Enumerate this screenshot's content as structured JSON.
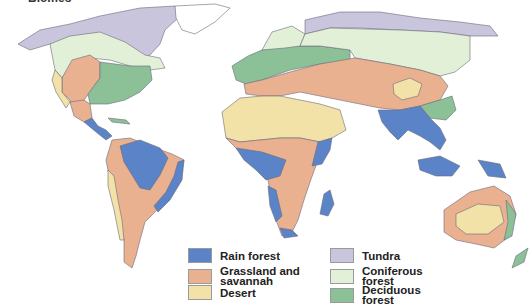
{
  "title": "Biomes",
  "colors": {
    "rain_forest": "#5b83c8",
    "grassland": "#eab191",
    "desert": "#f3e2a8",
    "tundra": "#c8c5dc",
    "coniferous": "#e3f0d8",
    "deciduous": "#8cc198",
    "ice": "#ffffff",
    "outline": "#6a6a7a"
  },
  "legend": {
    "items": [
      {
        "key": "rain_forest",
        "label": "Rain forest",
        "color": "#5b83c8"
      },
      {
        "key": "grassland",
        "label": "Grassland and savannah",
        "color": "#eab191"
      },
      {
        "key": "desert",
        "label": "Desert",
        "color": "#f3e2a8"
      },
      {
        "key": "tundra",
        "label": "Tundra",
        "color": "#c8c5dc"
      },
      {
        "key": "coniferous",
        "label": "Coniferous forest",
        "color": "#e3f0d8"
      },
      {
        "key": "deciduous",
        "label": "Deciduous forest",
        "color": "#8cc198"
      }
    ]
  }
}
